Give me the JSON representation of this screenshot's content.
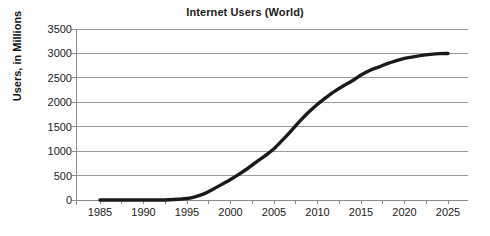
{
  "chart_data": {
    "type": "line",
    "title": "Internet Users (World)",
    "xlabel": "",
    "ylabel": "Users, in Millions",
    "xlim": [
      1983,
      2027
    ],
    "ylim": [
      0,
      3500
    ],
    "xticks": [
      1985,
      1990,
      1995,
      2000,
      2005,
      2010,
      2015,
      2020,
      2025
    ],
    "yticks": [
      0,
      500,
      1000,
      1500,
      2000,
      2500,
      3000,
      3500
    ],
    "grid": "horizontal",
    "legend": "none",
    "series": [
      {
        "name": "Internet Users",
        "x": [
          1985,
          1988,
          1990,
          1992,
          1993,
          1994,
          1995,
          1996,
          1997,
          1998,
          1999,
          2000,
          2001,
          2002,
          2003,
          2004,
          2005,
          2006,
          2007,
          2008,
          2009,
          2010,
          2011,
          2012,
          2013,
          2014,
          2015,
          2016,
          2017,
          2018,
          2019,
          2020,
          2021,
          2022,
          2023,
          2024,
          2025
        ],
        "values": [
          0,
          0,
          0,
          0,
          5,
          15,
          30,
          70,
          130,
          220,
          320,
          420,
          530,
          650,
          780,
          910,
          1050,
          1230,
          1420,
          1620,
          1800,
          1960,
          2100,
          2230,
          2340,
          2440,
          2560,
          2650,
          2720,
          2790,
          2850,
          2900,
          2930,
          2960,
          2980,
          2995,
          3000
        ]
      }
    ],
    "colors": {
      "line": "#1a1a1a",
      "grid": "#9a9a9a",
      "axis": "#8a8a8a",
      "text": "#1a1a1a",
      "background": "#ffffff"
    },
    "geometry": {
      "plot_left": 76,
      "plot_right": 468,
      "plot_top": 29,
      "plot_bottom": 200,
      "x_1985": 100,
      "x_2025": 448
    }
  }
}
